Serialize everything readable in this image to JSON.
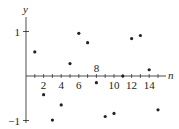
{
  "chart_data": {
    "type": "scatter",
    "title": "",
    "xlabel": "n",
    "ylabel": "y",
    "x": [
      1,
      2,
      3,
      4,
      5,
      6,
      7,
      8,
      9,
      10,
      11,
      12,
      13,
      14,
      15
    ],
    "values": [
      0.54,
      -0.42,
      -0.99,
      -0.65,
      0.28,
      0.96,
      0.75,
      -0.15,
      -0.91,
      -0.84,
      0.0,
      0.84,
      0.91,
      0.14,
      -0.76
    ],
    "xticks": [
      2,
      4,
      6,
      8,
      10,
      12,
      14
    ],
    "xtick_labels": [
      "2",
      "4",
      "6",
      "8",
      "10",
      "12",
      "14"
    ],
    "yticks": [
      1,
      -1
    ],
    "ytick_labels": [
      "1",
      "−1"
    ],
    "xlim": [
      0,
      16
    ],
    "ylim": [
      -1,
      1
    ],
    "grid": false,
    "legend": null,
    "colors": {
      "axis": "#222222",
      "point": "#222222"
    }
  }
}
